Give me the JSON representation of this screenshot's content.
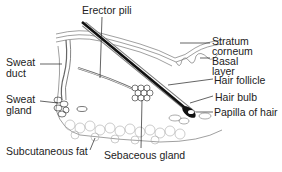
{
  "diagram": {
    "labels": {
      "erector_pili": "Erector pili",
      "sweat_duct_1": "Sweat",
      "sweat_duct_2": "duct",
      "sweat_gland_1": "Sweat",
      "sweat_gland_2": "gland",
      "subcutaneous_fat": "Subcutaneous fat",
      "sebaceous_gland": "Sebaceous gland",
      "stratum_corneum_1": "Stratum",
      "stratum_corneum_2": "corneum",
      "basal_layer_1": "Basal",
      "basal_layer_2": "layer",
      "hair_follicle": "Hair follicle",
      "hair_bulb": "Hair bulb",
      "papilla_of_hair": "Papilla of hair"
    }
  }
}
